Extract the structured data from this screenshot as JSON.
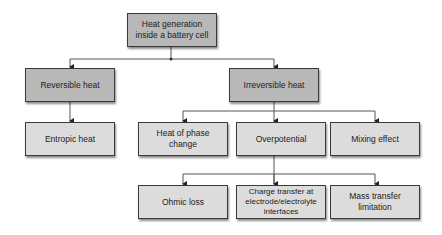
{
  "diagram": {
    "root": {
      "label": "Heat generation inside a battery cell"
    },
    "level1": [
      {
        "label": "Reversible heat"
      },
      {
        "label": "Irreversible heat"
      }
    ],
    "level2": [
      {
        "label": "Entropic heat",
        "parent": "Reversible heat"
      },
      {
        "label": "Heat of phase change",
        "parent": "Irreversible heat"
      },
      {
        "label": "Overpotential",
        "parent": "Irreversible heat"
      },
      {
        "label": "Mixing effect",
        "parent": "Irreversible heat"
      }
    ],
    "level3": [
      {
        "label": "Ohmic loss",
        "parent": "Overpotential"
      },
      {
        "label": "Charge transfer at electrode/electrolyte interfaces",
        "parent": "Overpotential"
      },
      {
        "label": "Mass transfer limitation",
        "parent": "Overpotential"
      }
    ],
    "colors": {
      "header_box": "#b8b8b8",
      "leaf_box": "#dcdcdc",
      "border": "#3a3a3a",
      "connector": "#555555"
    }
  }
}
